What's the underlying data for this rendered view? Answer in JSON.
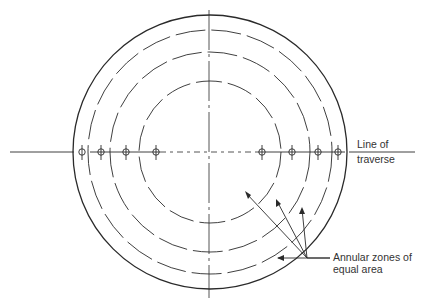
{
  "diagram": {
    "labels": {
      "traverse_line1": "Line of",
      "traverse_line2": "traverse",
      "zones_line1": "Annular zones of",
      "zones_line2": "equal area"
    },
    "geometry": {
      "center": [
        210,
        152
      ],
      "outer_radius": 137,
      "zone_radii": [
        122,
        100,
        71
      ],
      "probe_x_left": [
        82,
        101,
        126,
        156
      ],
      "probe_x_right": [
        262,
        292,
        318,
        338
      ]
    },
    "colors": {
      "stroke": "#2a2a2a",
      "text": "#333333"
    }
  }
}
